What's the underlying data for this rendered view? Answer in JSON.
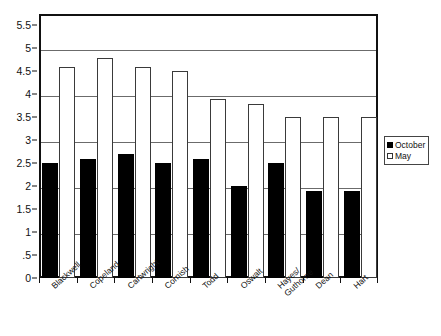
{
  "chart_data": {
    "type": "bar",
    "title": "",
    "subtitle": "",
    "xlabel": "",
    "ylabel": "",
    "ylim": [
      0,
      5.75
    ],
    "grid": true,
    "grid_values": [
      1,
      2,
      3,
      4,
      5
    ],
    "legend_position": "right",
    "categories": [
      "Blackwell",
      "Copeland",
      "Cartwright",
      "Cornish",
      "Todd",
      "Oswalt",
      "Hayes/\nGuthorne",
      "Dean",
      "Hart"
    ],
    "series": [
      {
        "name": "October",
        "color": "#000000",
        "values": [
          2.5,
          2.6,
          2.7,
          2.5,
          2.6,
          2.0,
          2.5,
          1.9,
          1.9
        ]
      },
      {
        "name": "May",
        "color": "#ffffff",
        "values": [
          4.6,
          4.8,
          4.6,
          4.5,
          3.9,
          3.8,
          3.5,
          3.5,
          3.5
        ]
      }
    ],
    "y_ticks": [
      {
        "value": 0,
        "label": "0"
      },
      {
        "value": 0.5,
        "label": ".5"
      },
      {
        "value": 1,
        "label": "1"
      },
      {
        "value": 1.5,
        "label": "1.5"
      },
      {
        "value": 2,
        "label": "2"
      },
      {
        "value": 2.5,
        "label": "2.5"
      },
      {
        "value": 3,
        "label": "3"
      },
      {
        "value": 3.5,
        "label": "3.5"
      },
      {
        "value": 4,
        "label": "4"
      },
      {
        "value": 4.5,
        "label": "4.5"
      },
      {
        "value": 5,
        "label": "5"
      },
      {
        "value": 5.5,
        "label": "5.5"
      }
    ]
  },
  "legend": {
    "items": [
      {
        "label": "October",
        "swatch": "filled"
      },
      {
        "label": "May",
        "swatch": "empty"
      }
    ]
  }
}
